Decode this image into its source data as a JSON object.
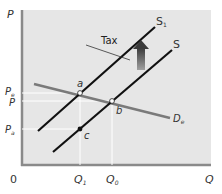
{
  "diagram": {
    "axes": {
      "y_label": "P",
      "x_label": "Q",
      "origin_label": "0"
    },
    "price_labels": {
      "pe": {
        "main": "P",
        "sub": "e"
      },
      "p": {
        "main": "P",
        "sub": ""
      },
      "pa": {
        "main": "P",
        "sub": "a"
      }
    },
    "quantity_labels": {
      "q1": {
        "main": "Q",
        "sub": "1"
      },
      "q0": {
        "main": "Q",
        "sub": "0"
      }
    },
    "curves": {
      "supply_after_tax": {
        "main": "S",
        "sub": "1"
      },
      "supply": {
        "main": "S",
        "sub": ""
      },
      "demand": {
        "main": "D",
        "sub": "e"
      }
    },
    "points": {
      "a": "a",
      "b": "b",
      "c": "c"
    },
    "tax_label": "Tax",
    "colors": {
      "plot_bg": "#e6e6e6",
      "axis": "#8a8a8a",
      "supply": "#111111",
      "demand": "#7a7a7a",
      "arrow_top": "#444444",
      "arrow_bottom": "#9a9a9a"
    }
  }
}
